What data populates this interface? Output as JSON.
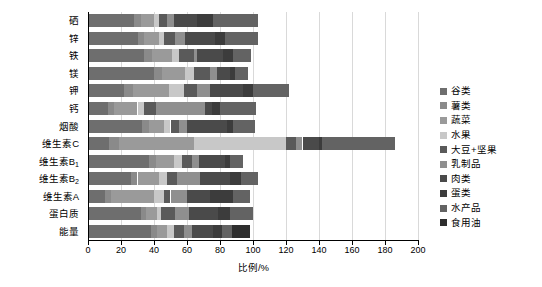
{
  "chart_data": {
    "type": "bar",
    "orientation": "horizontal",
    "stacked": true,
    "title": "",
    "xlabel": "比例/%",
    "ylabel": "",
    "xlim": [
      0,
      200
    ],
    "xticks": [
      0,
      20,
      40,
      60,
      80,
      100,
      120,
      140,
      160,
      180,
      200
    ],
    "grid": true,
    "legend_position": "right",
    "categories": [
      "硒",
      "锌",
      "铁",
      "镁",
      "钾",
      "钙",
      "烟酸",
      "维生素C",
      "维生素B₁",
      "维生素B₂",
      "维生素A",
      "蛋白质",
      "能量"
    ],
    "series": [
      {
        "name": "谷类",
        "color": "#6e6e6e",
        "values": [
          28,
          30,
          34,
          40,
          22,
          12,
          33,
          13,
          37,
          26,
          10,
          32,
          38
        ]
      },
      {
        "name": "薯类",
        "color": "#8a8a8a",
        "values": [
          4,
          4,
          5,
          5,
          5,
          4,
          4,
          6,
          4,
          4,
          4,
          3,
          4
        ]
      },
      {
        "name": "蔬菜",
        "color": "#9a9a9a",
        "values": [
          8,
          9,
          12,
          14,
          22,
          14,
          9,
          45,
          11,
          13,
          26,
          7,
          6
        ]
      },
      {
        "name": "水果",
        "color": "#c8c8c8",
        "values": [
          3,
          3,
          4,
          5,
          9,
          4,
          4,
          56,
          5,
          5,
          6,
          2,
          4
        ]
      },
      {
        "name": "大豆+坚果",
        "color": "#5a5a5a",
        "values": [
          5,
          7,
          9,
          10,
          8,
          7,
          5,
          6,
          6,
          6,
          4,
          9,
          6
        ]
      },
      {
        "name": "乳制品",
        "color": "#8f8f8f",
        "values": [
          4,
          6,
          2,
          4,
          8,
          30,
          5,
          4,
          4,
          14,
          10,
          8,
          5
        ]
      },
      {
        "name": "肉类",
        "color": "#4a4a4a",
        "values": [
          14,
          18,
          16,
          8,
          20,
          4,
          24,
          10,
          16,
          18,
          14,
          18,
          13
        ]
      },
      {
        "name": "蛋类",
        "color": "#3c3c3c",
        "values": [
          10,
          6,
          6,
          3,
          6,
          5,
          4,
          2,
          3,
          7,
          14,
          7,
          5
        ]
      },
      {
        "name": "水产品",
        "color": "#636363",
        "values": [
          27,
          20,
          11,
          8,
          22,
          22,
          13,
          44,
          8,
          10,
          10,
          14,
          6
        ]
      },
      {
        "name": "食用油",
        "color": "#2e2e2e",
        "values": [
          0,
          0,
          0,
          0,
          0,
          0,
          0,
          0,
          0,
          0,
          0,
          0,
          11
        ]
      }
    ],
    "row_totals": [
      103,
      103,
      99,
      97,
      122,
      102,
      101,
      186,
      94,
      103,
      98,
      100,
      98
    ]
  },
  "legend": {
    "items": [
      {
        "label": "谷类",
        "color": "#6e6e6e"
      },
      {
        "label": "薯类",
        "color": "#8a8a8a"
      },
      {
        "label": "蔬菜",
        "color": "#9a9a9a"
      },
      {
        "label": "水果",
        "color": "#c8c8c8"
      },
      {
        "label": "大豆+坚果",
        "color": "#5a5a5a"
      },
      {
        "label": "乳制品",
        "color": "#8f8f8f"
      },
      {
        "label": "肉类",
        "color": "#4a4a4a"
      },
      {
        "label": "蛋类",
        "color": "#3c3c3c"
      },
      {
        "label": "水产品",
        "color": "#636363"
      },
      {
        "label": "食用油",
        "color": "#2e2e2e"
      }
    ]
  },
  "axis": {
    "x_label": "比例/%",
    "tick_labels": [
      "0",
      "20",
      "40",
      "60",
      "80",
      "100",
      "120",
      "140",
      "160",
      "180",
      "200"
    ]
  },
  "y_labels": [
    {
      "text": "硒",
      "sub": ""
    },
    {
      "text": "锌",
      "sub": ""
    },
    {
      "text": "铁",
      "sub": ""
    },
    {
      "text": "镁",
      "sub": ""
    },
    {
      "text": "钾",
      "sub": ""
    },
    {
      "text": "钙",
      "sub": ""
    },
    {
      "text": "烟酸",
      "sub": ""
    },
    {
      "text": "维生素C",
      "sub": ""
    },
    {
      "text": "维生素B",
      "sub": "1"
    },
    {
      "text": "维生素B",
      "sub": "2"
    },
    {
      "text": "维生素A",
      "sub": ""
    },
    {
      "text": "蛋白质",
      "sub": ""
    },
    {
      "text": "能量",
      "sub": ""
    }
  ]
}
